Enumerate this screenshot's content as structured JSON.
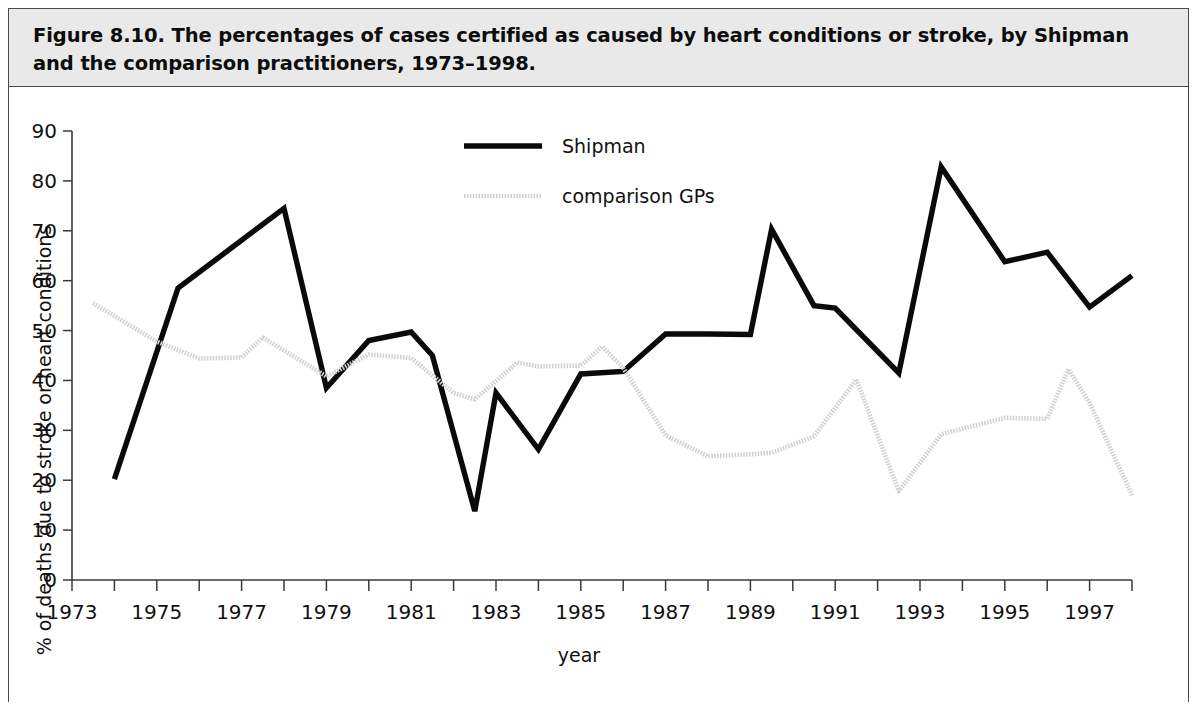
{
  "figure": {
    "caption": "Figure 8.10. The percentages of cases certified as caused by heart conditions or stroke, by Shipman and the comparison practitioners, 1973–1998."
  },
  "chart_data": {
    "type": "line",
    "title": "",
    "xlabel": "year",
    "ylabel": "% of deaths due to stroke or heart conditions",
    "xlim": [
      1973,
      1998
    ],
    "ylim": [
      0,
      90
    ],
    "ytick_step": 10,
    "yticks": [
      0,
      10,
      20,
      30,
      40,
      50,
      60,
      70,
      80,
      90
    ],
    "xticks_major": [
      1973,
      1975,
      1977,
      1979,
      1981,
      1983,
      1985,
      1987,
      1989,
      1991,
      1993,
      1995,
      1997
    ],
    "xticks_all": [
      1973,
      1974,
      1975,
      1976,
      1977,
      1978,
      1979,
      1980,
      1981,
      1982,
      1983,
      1984,
      1985,
      1986,
      1987,
      1988,
      1989,
      1990,
      1991,
      1992,
      1993,
      1994,
      1995,
      1996,
      1997,
      1998
    ],
    "grid": false,
    "legend_position": "top-center",
    "series": [
      {
        "name": "Shipman",
        "color": "#0a0a0a",
        "style": "solid-thick",
        "x": [
          1974,
          1975.5,
          1978,
          1979,
          1980,
          1981,
          1981.5,
          1982.5,
          1983,
          1984,
          1985,
          1986,
          1987,
          1988,
          1989,
          1989.5,
          1990.5,
          1991,
          1992.5,
          1993.5,
          1995,
          1996,
          1997,
          1998
        ],
        "values": [
          20.2,
          58.5,
          74.5,
          38.5,
          48.0,
          49.7,
          45.0,
          13.8,
          37.5,
          26.2,
          41.3,
          41.8,
          49.3,
          49.3,
          49.2,
          70.3,
          55.0,
          54.5,
          41.5,
          82.8,
          63.8,
          65.7,
          54.7,
          61.0
        ]
      },
      {
        "name": "comparison GPs",
        "color": "#d2d2d2",
        "style": "dotted",
        "x": [
          1973.5,
          1975,
          1976,
          1977,
          1977.5,
          1979,
          1980,
          1981,
          1982,
          1982.5,
          1983.5,
          1984,
          1985,
          1985.5,
          1986,
          1987,
          1988,
          1989,
          1989.5,
          1990.5,
          1991.5,
          1992.5,
          1993.5,
          1995,
          1996,
          1996.5,
          1997,
          1998
        ],
        "values": [
          55.5,
          47.8,
          44.4,
          44.6,
          48.6,
          40.8,
          45.2,
          44.5,
          37.5,
          36.2,
          43.6,
          42.8,
          43.0,
          46.8,
          42.5,
          29.0,
          24.8,
          25.2,
          25.5,
          28.8,
          40.2,
          17.8,
          29.2,
          32.5,
          32.3,
          42.3,
          35.5,
          17.0
        ]
      }
    ],
    "legend": [
      {
        "label": "Shipman",
        "color": "#0a0a0a",
        "style": "solid-thick"
      },
      {
        "label": "comparison GPs",
        "color": "#d2d2d2",
        "style": "dotted"
      }
    ]
  },
  "colors": {
    "caption_band": "#e9e9e9",
    "frame_border": "#4a4a4a",
    "axis": "#3a3a3a",
    "plot_background": "#ffffff"
  }
}
